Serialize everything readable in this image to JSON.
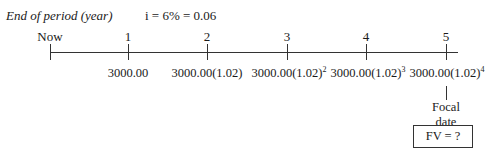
{
  "header": {
    "axis_title": "End of period (year)",
    "interest": "i = 6% = 0.06"
  },
  "timeline": {
    "labels": [
      "Now",
      "1",
      "2",
      "3",
      "4",
      "5"
    ],
    "values": [
      {
        "base": "3000.00",
        "exp": ""
      },
      {
        "base": "3000.00(1.02)",
        "exp": ""
      },
      {
        "base": "3000.00(1.02)",
        "exp": "2"
      },
      {
        "base": "3000.00(1.02)",
        "exp": "3"
      },
      {
        "base": "3000.00(1.02)",
        "exp": "4"
      }
    ]
  },
  "focal": {
    "line1": "Focal",
    "line2": "date"
  },
  "result_box": "FV = ?"
}
